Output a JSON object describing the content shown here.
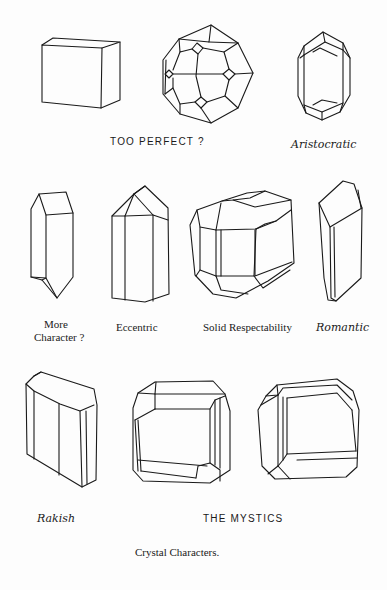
{
  "page": {
    "caption": "Crystal Characters.",
    "background_color": "#fdfdfd",
    "ink_color": "#1a1a1a"
  },
  "rows": [
    {
      "crystals": [
        {
          "id": "cube",
          "shape": "cube"
        },
        {
          "id": "polyhedron",
          "shape": "trapezohedron"
        }
      ],
      "label": "TOO PERFECT ?"
    },
    {
      "crystals": [
        {
          "id": "aristocratic",
          "shape": "elongated-hexagonal-bipyramid"
        }
      ],
      "label": "Aristocratic"
    }
  ],
  "labels": {
    "too_perfect": "TOO PERFECT ?",
    "aristocratic": "Aristocratic",
    "more_character_line1": "More",
    "more_character_line2": "Character ?",
    "eccentric": "Eccentric",
    "solid_respectability": "Solid Respectability",
    "romantic": "Romantic",
    "rakish": "Rakish",
    "the_mystics": "THE  MYSTICS",
    "caption": "Crystal  Characters."
  }
}
